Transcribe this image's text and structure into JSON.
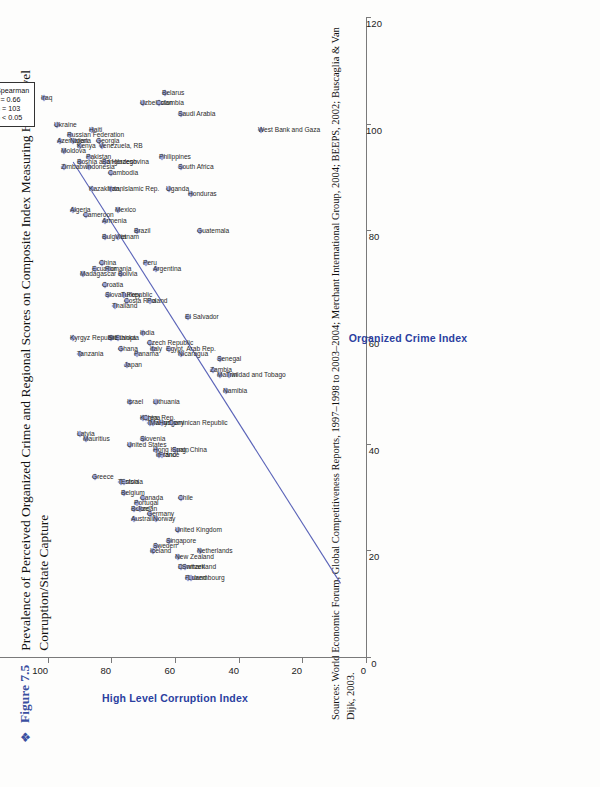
{
  "figure": {
    "bullet": "❖",
    "label": "Figure 7.5",
    "title": "Prevalence of Perceived Organized Crime and Regional Scores on Composite Index Measuring High-Level Corruption/State Capture"
  },
  "sources": {
    "line1": "Sources: World Economic Forum, Global Competitiveness Reports, 1997–1998 to 2003–2004; Merchant International Group, 2004; BEEPS, 2002; Buscaglia & Van",
    "line2": "Dijk, 2003."
  },
  "stats": {
    "title": "Spearman",
    "r": "r = 0.66",
    "n": "n = 103",
    "p": "p < 0.05"
  },
  "chart_data": {
    "type": "scatter",
    "title": "Prevalence of Perceived Organized Crime and Regional Scores on Composite Index Measuring High-Level Corruption/State Capture",
    "xlabel": "Organized Crime Index",
    "ylabel": "High Level Corruption Index",
    "xlim": [
      0,
      120
    ],
    "ylim": [
      0,
      120
    ],
    "xticks": [
      0,
      20,
      40,
      60,
      80,
      100,
      120
    ],
    "yticks": [
      0,
      20,
      40,
      60,
      80,
      100,
      120
    ],
    "grid": false,
    "legend": "none",
    "marker": "diamond",
    "marker_color": "#9aa3d4",
    "trendline": {
      "x0": 14,
      "y0": 8,
      "x1": 93,
      "y1": 92,
      "color": "#5a63b8"
    },
    "annotation": "Spearman r = 0.66, n = 103, p < 0.05",
    "points": [
      {
        "label": "Iraq",
        "x": 105,
        "y": 101
      },
      {
        "label": "Azerbaijan",
        "x": 97,
        "y": 96
      },
      {
        "label": "Ukraine",
        "x": 100,
        "y": 97
      },
      {
        "label": "Moldova",
        "x": 95,
        "y": 95
      },
      {
        "label": "Russian Federation",
        "x": 98,
        "y": 93
      },
      {
        "label": "Nigeria",
        "x": 97,
        "y": 92
      },
      {
        "label": "Kenya",
        "x": 96,
        "y": 90
      },
      {
        "label": "Zimbabwe",
        "x": 92,
        "y": 95
      },
      {
        "label": "Bosnia and Herzegovina",
        "x": 93,
        "y": 90
      },
      {
        "label": "Haiti",
        "x": 99,
        "y": 86
      },
      {
        "label": "Georgia",
        "x": 97,
        "y": 84
      },
      {
        "label": "Venezuela, RB",
        "x": 96,
        "y": 83
      },
      {
        "label": "Indonesia",
        "x": 92,
        "y": 87
      },
      {
        "label": "Pakistan",
        "x": 94,
        "y": 87
      },
      {
        "label": "Bangladesh",
        "x": 93,
        "y": 82
      },
      {
        "label": "Kazakhstan",
        "x": 88,
        "y": 86
      },
      {
        "label": "Cambodia",
        "x": 91,
        "y": 80
      },
      {
        "label": "Iran, Islamic Rep.",
        "x": 88,
        "y": 80
      },
      {
        "label": "Algeria",
        "x": 84,
        "y": 92
      },
      {
        "label": "Cameroon",
        "x": 83,
        "y": 88
      },
      {
        "label": "Uzbekistan",
        "x": 104,
        "y": 70
      },
      {
        "label": "Belarus",
        "x": 106,
        "y": 63
      },
      {
        "label": "Colombia",
        "x": 104,
        "y": 65
      },
      {
        "label": "Philippines",
        "x": 94,
        "y": 64
      },
      {
        "label": "Saudi Arabia",
        "x": 102,
        "y": 58
      },
      {
        "label": "South Africa",
        "x": 92,
        "y": 58
      },
      {
        "label": "Uganda",
        "x": 88,
        "y": 62
      },
      {
        "label": "Honduras",
        "x": 87,
        "y": 55
      },
      {
        "label": "Guatemala",
        "x": 80,
        "y": 52
      },
      {
        "label": "West Bank and Gaza",
        "x": 99,
        "y": 33
      },
      {
        "label": "Mexico",
        "x": 84,
        "y": 78
      },
      {
        "label": "Brazil",
        "x": 80,
        "y": 72
      },
      {
        "label": "Armenia",
        "x": 82,
        "y": 82
      },
      {
        "label": "Bulgaria",
        "x": 79,
        "y": 82
      },
      {
        "label": "Vietnam",
        "x": 79,
        "y": 78
      },
      {
        "label": "Ecuador",
        "x": 73,
        "y": 85
      },
      {
        "label": "China",
        "x": 74,
        "y": 83
      },
      {
        "label": "Romania",
        "x": 73,
        "y": 81
      },
      {
        "label": "Croatia",
        "x": 70,
        "y": 82
      },
      {
        "label": "Slovak Republic",
        "x": 68,
        "y": 81
      },
      {
        "label": "Bolivia",
        "x": 72,
        "y": 77
      },
      {
        "label": "Madagascar",
        "x": 72,
        "y": 89
      },
      {
        "label": "Peru",
        "x": 74,
        "y": 69
      },
      {
        "label": "Argentina",
        "x": 73,
        "y": 66
      },
      {
        "label": "Turkey",
        "x": 68,
        "y": 76
      },
      {
        "label": "Costa Rica",
        "x": 67,
        "y": 75
      },
      {
        "label": "Thailand",
        "x": 66,
        "y": 79
      },
      {
        "label": "Poland",
        "x": 67,
        "y": 68
      },
      {
        "label": "El Salvador",
        "x": 64,
        "y": 56
      },
      {
        "label": "Sri Lanka",
        "x": 60,
        "y": 80
      },
      {
        "label": "Ethiopia",
        "x": 60,
        "y": 78
      },
      {
        "label": "Ghana",
        "x": 58,
        "y": 77
      },
      {
        "label": "India",
        "x": 61,
        "y": 70
      },
      {
        "label": "Czech Republic",
        "x": 59,
        "y": 68
      },
      {
        "label": "Italy",
        "x": 58,
        "y": 67
      },
      {
        "label": "Egypt, Arab Rep.",
        "x": 58,
        "y": 62
      },
      {
        "label": "Nicaragua",
        "x": 57,
        "y": 58
      },
      {
        "label": "Panama",
        "x": 57,
        "y": 72
      },
      {
        "label": "Japan",
        "x": 55,
        "y": 75
      },
      {
        "label": "Kyrgyz Republic",
        "x": 60,
        "y": 92
      },
      {
        "label": "Tanzania",
        "x": 57,
        "y": 90
      },
      {
        "label": "Zambia",
        "x": 54,
        "y": 48
      },
      {
        "label": "Malawi",
        "x": 53,
        "y": 46
      },
      {
        "label": "Namibia",
        "x": 50,
        "y": 44
      },
      {
        "label": "Senegal",
        "x": 56,
        "y": 46
      },
      {
        "label": "Trinidad and Tobago",
        "x": 53,
        "y": 43
      },
      {
        "label": "Lithuania",
        "x": 48,
        "y": 66
      },
      {
        "label": "Israel",
        "x": 48,
        "y": 74
      },
      {
        "label": "Korea, Rep.",
        "x": 45,
        "y": 70
      },
      {
        "label": "China",
        "x": 45,
        "y": 69
      },
      {
        "label": "Taiwan",
        "x": 44,
        "y": 68
      },
      {
        "label": "Malaysia",
        "x": 44,
        "y": 67
      },
      {
        "label": "Hungary",
        "x": 44,
        "y": 64
      },
      {
        "label": "Dominican Republic",
        "x": 44,
        "y": 61
      },
      {
        "label": "Latvia",
        "x": 42,
        "y": 90
      },
      {
        "label": "Mauritius",
        "x": 41,
        "y": 88
      },
      {
        "label": "Slovenia",
        "x": 41,
        "y": 70
      },
      {
        "label": "Hong Kong, China",
        "x": 39,
        "y": 66
      },
      {
        "label": "Ireland",
        "x": 38,
        "y": 65
      },
      {
        "label": "France",
        "x": 38,
        "y": 64
      },
      {
        "label": "Spain",
        "x": 39,
        "y": 60
      },
      {
        "label": "United States",
        "x": 40,
        "y": 74
      },
      {
        "label": "Tunisia",
        "x": 33,
        "y": 77
      },
      {
        "label": "Estonia",
        "x": 33,
        "y": 76
      },
      {
        "label": "Greece",
        "x": 34,
        "y": 85
      },
      {
        "label": "Belgium",
        "x": 31,
        "y": 76
      },
      {
        "label": "Portugal",
        "x": 29,
        "y": 72
      },
      {
        "label": "Canada",
        "x": 30,
        "y": 70
      },
      {
        "label": "Belize",
        "x": 28,
        "y": 73
      },
      {
        "label": "Jordan",
        "x": 28,
        "y": 71
      },
      {
        "label": "Australia",
        "x": 26,
        "y": 73
      },
      {
        "label": "Germany",
        "x": 27,
        "y": 68
      },
      {
        "label": "Norway",
        "x": 26,
        "y": 66
      },
      {
        "label": "Chile",
        "x": 30,
        "y": 58
      },
      {
        "label": "United Kingdom",
        "x": 24,
        "y": 59
      },
      {
        "label": "Sweden",
        "x": 21,
        "y": 66
      },
      {
        "label": "Iceland",
        "x": 20,
        "y": 67
      },
      {
        "label": "Singapore",
        "x": 22,
        "y": 62
      },
      {
        "label": "New Zealand",
        "x": 19,
        "y": 59
      },
      {
        "label": "Denmark",
        "x": 17,
        "y": 58
      },
      {
        "label": "Switzerland",
        "x": 17,
        "y": 57
      },
      {
        "label": "Finland",
        "x": 15,
        "y": 56
      },
      {
        "label": "Luxembourg",
        "x": 15,
        "y": 55
      },
      {
        "label": "Netherlands",
        "x": 20,
        "y": 52
      }
    ]
  },
  "axes": {
    "x_title": "Organized Crime Index",
    "y_title": "High Level Corruption Index"
  }
}
